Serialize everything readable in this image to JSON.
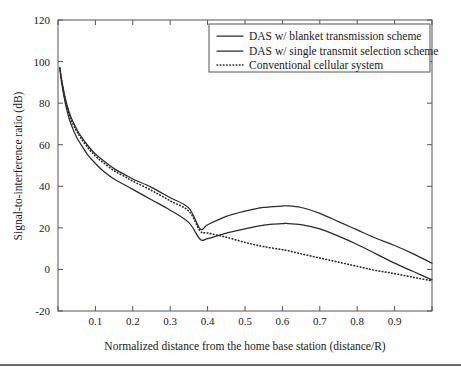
{
  "chart_data": {
    "type": "line",
    "title": "",
    "xlabel": "Normalized distance from the home base station (distance/R)",
    "ylabel": "Signal-to-interference ratio (dB)",
    "xlim": [
      0,
      1
    ],
    "ylim": [
      -20,
      120
    ],
    "xticks": [
      0,
      0.1,
      0.2,
      0.3,
      0.4,
      0.5,
      0.6,
      0.7,
      0.8,
      0.9,
      1
    ],
    "xticklabels": [
      "",
      "0.1",
      "0.2",
      "0.3",
      "0.4",
      "0.5",
      "0.6",
      "0.7",
      "0.8",
      "0.9",
      ""
    ],
    "yticks": [
      -20,
      0,
      20,
      40,
      60,
      80,
      100,
      120
    ],
    "yticklabels": [
      "-20",
      "0",
      "20",
      "40",
      "60",
      "80",
      "100",
      "120"
    ],
    "grid": false,
    "legend_position": "upper right",
    "line_color": "#2b2b2b",
    "x": [
      0.005,
      0.01,
      0.02,
      0.03,
      0.04,
      0.05,
      0.06,
      0.08,
      0.1,
      0.12,
      0.15,
      0.18,
      0.2,
      0.25,
      0.3,
      0.35,
      0.38,
      0.4,
      0.45,
      0.5,
      0.55,
      0.6,
      0.61,
      0.65,
      0.7,
      0.75,
      0.8,
      0.85,
      0.9,
      0.95,
      1.0
    ],
    "series": [
      {
        "name": "DAS w/ blanket transmission scheme",
        "style": "solid",
        "values": [
          97,
          91,
          82,
          75.5,
          71,
          67.5,
          64.5,
          59.5,
          55.5,
          52.5,
          48.5,
          45.5,
          43.5,
          39.5,
          34.5,
          29.5,
          19.5,
          21.5,
          25.5,
          28,
          29.8,
          30.5,
          30.6,
          29.8,
          27,
          23,
          19,
          15,
          11.5,
          7.5,
          3
        ]
      },
      {
        "name": "DAS w/ single transmit selection scheme",
        "style": "solid",
        "values": [
          96.5,
          89.5,
          79.5,
          72.5,
          67.5,
          63.5,
          60.5,
          55,
          51,
          47.5,
          43.5,
          40.5,
          38.5,
          33.5,
          28.5,
          22.5,
          14.5,
          14.8,
          17.5,
          19.5,
          21.3,
          22,
          22.1,
          21.5,
          19.5,
          16,
          12,
          7.5,
          3,
          -1,
          -5
        ]
      },
      {
        "name": "Conventional cellular system",
        "style": "dotted",
        "values": [
          97,
          90.5,
          81,
          74.5,
          70,
          66.5,
          63.5,
          58.5,
          54.5,
          51.5,
          47.5,
          44.5,
          42.5,
          38,
          33,
          28,
          18.5,
          17.5,
          15.5,
          13,
          11,
          9.5,
          9.2,
          7.5,
          5.5,
          3.5,
          1.5,
          -0.5,
          -2,
          -3.8,
          -5.5
        ]
      }
    ],
    "legend_items": [
      "DAS w/ blanket transmission scheme",
      "DAS w/ single transmit selection scheme",
      "Conventional cellular system"
    ]
  }
}
